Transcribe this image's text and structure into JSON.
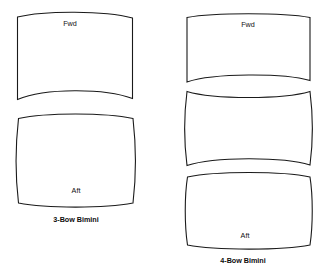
{
  "figure": {
    "background_color": "#ffffff",
    "stroke_color": "#1a1a1a",
    "fill_color": "#ffffff"
  },
  "groups": [
    {
      "id": "three-bow",
      "caption": "3-Bow Bimini",
      "caption_x": 76,
      "caption_y": 222,
      "panel_count": 2,
      "panels": [
        {
          "id": "three-bow-panel-1",
          "label": "Fwd",
          "label_x": 70,
          "label_y": 26,
          "shape": "top-convex-bottom-concave",
          "path": "M 17.5 17.0 C 45 10.5, 104 10.5, 132.5 18.0 L 132.5 98.5 C 104 88.0, 45 88.0, 17.5 99.5 Z"
        },
        {
          "id": "three-bow-panel-2",
          "label": "Aft",
          "label_x": 76,
          "label_y": 193,
          "shape": "barrel",
          "path": "M 18.5 118.5 C 46 112.5, 105 112.5, 133.0 118.5 C 136.0 145, 136.0 178, 133.0 203.0 C 105 208.5, 46 208.5, 18.5 203.0 C 15.5 178, 15.5 145, 18.5 118.5 Z"
        }
      ]
    },
    {
      "id": "four-bow",
      "caption": "4-Bow Bimini",
      "caption_x": 243,
      "caption_y": 263,
      "panel_count": 3,
      "panels": [
        {
          "id": "four-bow-panel-1",
          "label": "Fwd",
          "label_x": 248,
          "label_y": 27,
          "shape": "top-convex-bottom-concave",
          "path": "M 187.0 17.5 C 214 12.5, 283 12.5, 310.0 17.5 L 310.0 80.5 C 283 73.0, 214 73.0, 187.0 82.0 Z"
        },
        {
          "id": "four-bow-panel-2",
          "label": "",
          "label_x": 0,
          "label_y": 0,
          "shape": "hourglass",
          "path": "M 187.0 91.5 C 214 99.5, 283 99.5, 310.0 91.5 C 313.0 115, 313.0 142, 310.0 165.0 C 283 156.5, 214 156.5, 187.0 165.5 C 184.0 142, 184.0 115, 187.0 91.5 Z"
        },
        {
          "id": "four-bow-panel-3",
          "label": "Aft",
          "label_x": 245,
          "label_y": 238,
          "shape": "barrel",
          "path": "M 187.5 177.0 C 215 171.0, 283 171.0, 310.0 177.0 C 313.0 196, 313.0 225, 310.0 245.0 C 283 250.5, 215 250.5, 187.5 245.0 C 184.5 225, 184.5 196, 187.5 177.0 Z"
        }
      ]
    }
  ]
}
